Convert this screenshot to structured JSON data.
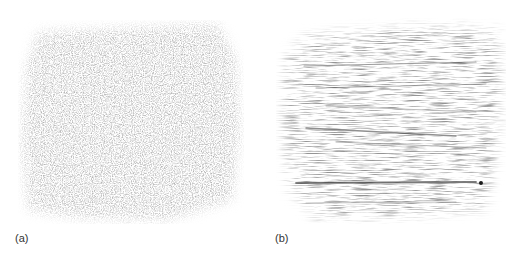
{
  "figure": {
    "panels": [
      {
        "id": "a",
        "label": "(a)",
        "description": "fine, diffuse granular pencil-rubbing texture"
      },
      {
        "id": "b",
        "label": "(b)",
        "description": "pencil-rubbing texture with strong horizontal streaks"
      }
    ]
  }
}
